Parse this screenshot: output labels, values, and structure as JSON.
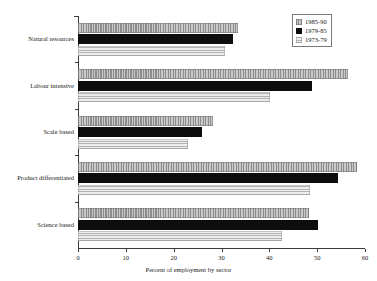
{
  "chart_data": {
    "type": "bar",
    "orientation": "horizontal",
    "title": "",
    "subtitle": "",
    "xlabel": "Percent of employment by sector",
    "ylabel": "",
    "xlim": [
      0,
      60
    ],
    "xticks": [
      0,
      10,
      20,
      30,
      40,
      50,
      60
    ],
    "xtick_labels": [
      "0",
      "10",
      "20",
      "30",
      "40",
      "50",
      "60"
    ],
    "grid": false,
    "legend_position": "top-right",
    "categories": [
      "Natural resources",
      "Labour intensive",
      "Scale based",
      "Product differentiated",
      "Science based"
    ],
    "series": [
      {
        "name": "1985-90",
        "pattern": "vertical-hatch-gray",
        "color": "#a8a8a8",
        "values": [
          33.4,
          56.5,
          28.2,
          58.4,
          48.2
        ]
      },
      {
        "name": "1979-85",
        "pattern": "solid-black",
        "color": "#0d0d0d",
        "values": [
          32.4,
          48.9,
          26.0,
          54.3,
          50.1
        ]
      },
      {
        "name": "1973-79",
        "pattern": "horizontal-stripe-light-gray",
        "color": "#d6d6d6",
        "values": [
          30.8,
          40.2,
          23.1,
          48.4,
          42.7
        ]
      }
    ]
  },
  "legend": {
    "entries": [
      {
        "label": "1985-90"
      },
      {
        "label": "1979-85"
      },
      {
        "label": "1973-79"
      }
    ]
  },
  "axis": {
    "x_title": "Percent of employment by sector"
  }
}
